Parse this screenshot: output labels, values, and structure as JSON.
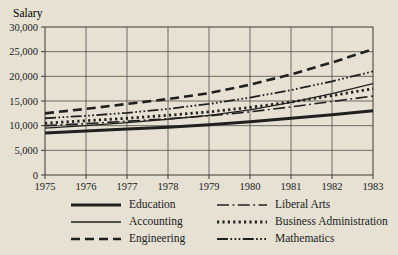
{
  "page": {
    "background": "#e6e1d2",
    "ink": "#20201e",
    "grid_color": "#3c3a36"
  },
  "chart_data": {
    "type": "line",
    "title": "",
    "ylabel": "Salary",
    "xlabel": "",
    "grid": true,
    "legend_position": "bottom",
    "ylim": [
      0,
      30000
    ],
    "ytick_step": 5000,
    "ytick_labels": [
      "30,000",
      "25,000",
      "20,000",
      "15,000",
      "10,000",
      "5,000",
      "0"
    ],
    "x": [
      1975,
      1976,
      1977,
      1978,
      1979,
      1980,
      1981,
      1982,
      1983
    ],
    "xtick_labels": [
      "1975",
      "1976",
      "1977",
      "1978",
      "1979",
      "1980",
      "1981",
      "1982",
      "1983"
    ],
    "series": [
      {
        "name": "Education",
        "line_style": "thick-solid",
        "values": [
          8500,
          8900,
          9300,
          9700,
          10200,
          10800,
          11500,
          12200,
          13000
        ]
      },
      {
        "name": "Accounting",
        "line_style": "thin-solid",
        "values": [
          9500,
          10000,
          10600,
          11300,
          12100,
          13200,
          14700,
          16500,
          18500
        ]
      },
      {
        "name": "Engineering",
        "line_style": "dashed",
        "values": [
          12500,
          13400,
          14400,
          15400,
          16600,
          18300,
          20400,
          22800,
          25500
        ]
      },
      {
        "name": "Liberal Arts",
        "line_style": "dash-dot",
        "values": [
          10000,
          10400,
          10900,
          11400,
          12000,
          12800,
          13800,
          14900,
          16000
        ]
      },
      {
        "name": "Business Administration",
        "line_style": "dotted",
        "values": [
          10500,
          11000,
          11500,
          12100,
          12800,
          13700,
          14800,
          16100,
          17500
        ]
      },
      {
        "name": "Mathematics",
        "line_style": "dash-triple-dot",
        "values": [
          11500,
          12000,
          12600,
          13400,
          14400,
          15700,
          17200,
          19000,
          21000
        ]
      }
    ],
    "legend_columns": [
      [
        "Education",
        "Accounting",
        "Engineering"
      ],
      [
        "Liberal Arts",
        "Business Administration",
        "Mathematics"
      ]
    ]
  }
}
